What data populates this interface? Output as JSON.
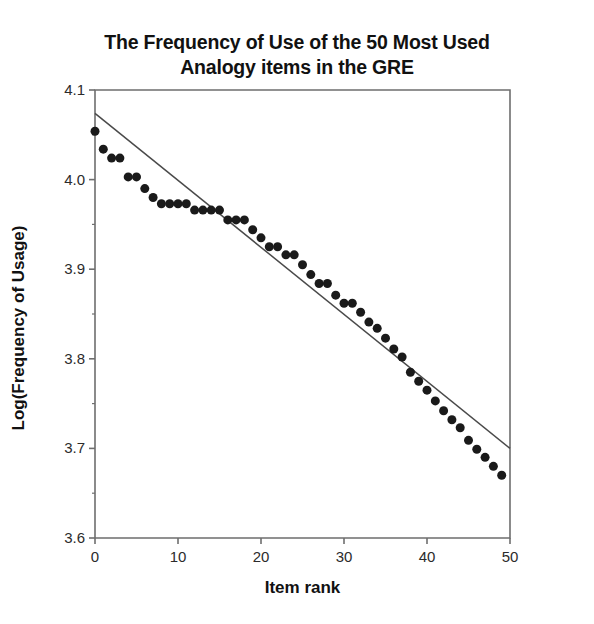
{
  "chart_data": {
    "type": "scatter",
    "title": "The Frequency of Use of the 50 Most Used\nAnalogy items in the GRE",
    "xlabel": "Item rank",
    "ylabel": "Log(Frequency of Usage)",
    "xlim": [
      0,
      50
    ],
    "ylim": [
      3.6,
      4.1
    ],
    "xticks": [
      0,
      10,
      20,
      30,
      40,
      50
    ],
    "xtick_labels": [
      "0",
      "10",
      "20",
      "30",
      "40",
      "50"
    ],
    "yticks": [
      3.6,
      3.7,
      3.8,
      3.9,
      4.0,
      4.1
    ],
    "ytick_labels": [
      "3.6",
      "3.7",
      "3.8",
      "3.9",
      "4.0",
      "4.1"
    ],
    "y_minor_ticks": [
      3.65,
      3.75,
      3.85,
      3.95,
      4.05
    ],
    "grid": false,
    "legend": false,
    "marker": "filled-circle",
    "marker_color": "#1a1a1a",
    "marker_size": 9,
    "line_color": "#4a4a4a",
    "axis_color": "#6e6e6e",
    "x": [
      0,
      1,
      2,
      3,
      4,
      5,
      6,
      7,
      8,
      9,
      10,
      11,
      12,
      13,
      14,
      15,
      16,
      17,
      18,
      19,
      20,
      21,
      22,
      23,
      24,
      25,
      26,
      27,
      28,
      29,
      30,
      31,
      32,
      33,
      34,
      35,
      36,
      37,
      38,
      39,
      40,
      41,
      42,
      43,
      44,
      45,
      46,
      47,
      48,
      49
    ],
    "values": [
      4.054,
      4.034,
      4.024,
      4.024,
      4.003,
      4.003,
      3.99,
      3.98,
      3.973,
      3.973,
      3.973,
      3.973,
      3.966,
      3.966,
      3.966,
      3.966,
      3.955,
      3.955,
      3.955,
      3.944,
      3.935,
      3.925,
      3.925,
      3.916,
      3.916,
      3.905,
      3.894,
      3.884,
      3.884,
      3.871,
      3.862,
      3.862,
      3.852,
      3.841,
      3.834,
      3.823,
      3.811,
      3.802,
      3.785,
      3.775,
      3.765,
      3.753,
      3.742,
      3.732,
      3.723,
      3.709,
      3.699,
      3.69,
      3.68,
      3.67
    ],
    "trend_line": {
      "label": "linear fit",
      "x": [
        0,
        50
      ],
      "y": [
        4.074,
        3.7
      ]
    },
    "series_name": "Log frequency of usage"
  }
}
